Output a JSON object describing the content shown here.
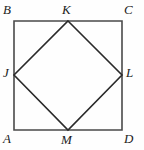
{
  "figure": {
    "kind": "geometry-diagram",
    "background_color": "#fefefe",
    "square": {
      "name": "ABCD",
      "stroke_color": "#4a4a4a",
      "stroke_width": 1.6,
      "fill": "none",
      "left": 14,
      "top": 21,
      "right": 122,
      "bottom": 130
    },
    "inner_square": {
      "name": "JKLM",
      "stroke_color": "#2a2a2a",
      "stroke_width": 1.6,
      "fill": "none"
    },
    "points": [
      {
        "id": "B",
        "label": "B",
        "role": "square-corner-top-left",
        "x": 14,
        "y": 21,
        "label_x": 3,
        "label_y": 3
      },
      {
        "id": "K",
        "label": "K",
        "role": "midpoint-top",
        "x": 68,
        "y": 21,
        "label_x": 62,
        "label_y": 3
      },
      {
        "id": "C",
        "label": "C",
        "role": "square-corner-top-right",
        "x": 122,
        "y": 21,
        "label_x": 124,
        "label_y": 3
      },
      {
        "id": "J",
        "label": "J",
        "role": "midpoint-left",
        "x": 14,
        "y": 75,
        "label_x": 3,
        "label_y": 66
      },
      {
        "id": "L",
        "label": "L",
        "role": "midpoint-right",
        "x": 122,
        "y": 75,
        "label_x": 126,
        "label_y": 66
      },
      {
        "id": "A",
        "label": "A",
        "role": "square-corner-bottom-left",
        "x": 14,
        "y": 130,
        "label_x": 3,
        "label_y": 132
      },
      {
        "id": "M",
        "label": "M",
        "role": "midpoint-bottom",
        "x": 68,
        "y": 130,
        "label_x": 61,
        "label_y": 133
      },
      {
        "id": "D",
        "label": "D",
        "role": "square-corner-bottom-right",
        "x": 122,
        "y": 130,
        "label_x": 124,
        "label_y": 132
      }
    ],
    "label_font_size": 13
  }
}
